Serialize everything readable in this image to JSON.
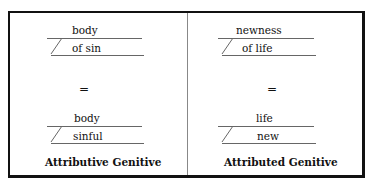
{
  "panels": [
    {
      "caption": "Attributive Genitive",
      "top_diagram": {
        "head": "body",
        "modifier": "of sin"
      },
      "equals": "=",
      "bottom_diagram": {
        "head": "body",
        "modifier": "sinful"
      }
    },
    {
      "caption": "Attributed Genitive",
      "top_diagram": {
        "head": "newness",
        "modifier": "of life"
      },
      "equals": "=",
      "bottom_diagram": {
        "head": "life",
        "modifier": "new"
      }
    }
  ]
}
